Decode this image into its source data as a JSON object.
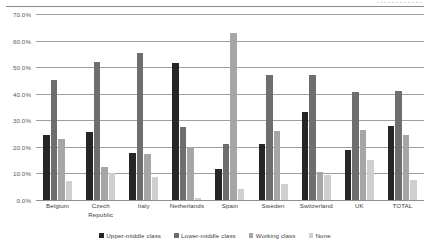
{
  "top_artifact": {
    "faint_text": "• • • • • • • • • • • •"
  },
  "chart_data": {
    "type": "bar",
    "title": "",
    "subtitle": "",
    "xlabel": "",
    "ylabel": "",
    "ylim": [
      0,
      70
    ],
    "ytick_values": [
      0,
      10,
      20,
      30,
      40,
      50,
      60,
      70
    ],
    "ytick_labels": [
      "0.0%",
      "10.0%",
      "20.0%",
      "30.0%",
      "40.0%",
      "50.0%",
      "60.0%",
      "70.0%"
    ],
    "grid": true,
    "grid_axis": "y",
    "legend_position": "bottom",
    "orientation": "vertical",
    "grouping": "grouped",
    "categories": [
      "Belgium",
      "Czech Republic",
      "Italy",
      "Netherlands",
      "Spain",
      "Sweden",
      "Switzerland",
      "UK",
      "TOTAL"
    ],
    "series": [
      {
        "name": "Upper-middle class",
        "color": "#262626",
        "values": [
          24.5,
          25.5,
          17.8,
          51.5,
          11.5,
          21.0,
          33.0,
          18.7,
          28.0
        ]
      },
      {
        "name": "Lower-middle class",
        "color": "#6e6e6e",
        "values": [
          45.0,
          52.0,
          55.5,
          27.5,
          21.0,
          47.0,
          47.0,
          40.5,
          41.0
        ]
      },
      {
        "name": "Working class",
        "color": "#a6a6a6",
        "values": [
          23.0,
          12.5,
          17.5,
          20.0,
          63.0,
          26.0,
          10.5,
          26.5,
          24.5
        ]
      },
      {
        "name": "None",
        "color": "#cfcfcf",
        "values": [
          7.0,
          10.0,
          8.8,
          0.7,
          4.0,
          6.0,
          9.5,
          15.0,
          7.5
        ]
      }
    ]
  }
}
